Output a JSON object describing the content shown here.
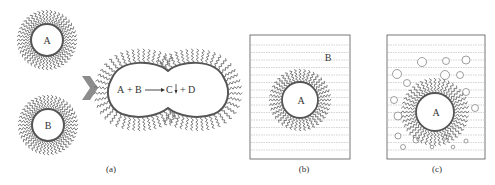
{
  "figure": {
    "panels": [
      {
        "id": "a",
        "caption": "(a)",
        "micelles": [
          {
            "label": "A"
          },
          {
            "label": "B"
          }
        ],
        "merged_reaction": {
          "reactant1": "A",
          "plus1": "+",
          "reactant2": "B",
          "product1": "C",
          "plus2": "+",
          "product2": "D",
          "precipitate_symbol": "↓"
        }
      },
      {
        "id": "b",
        "caption": "(b)",
        "core_label": "A",
        "medium_label": "B"
      },
      {
        "id": "c",
        "caption": "(c)",
        "core_label": "A"
      }
    ],
    "colors": {
      "surfactant": "#6e6e6e",
      "arrow": "#8c8c8c",
      "dashed_lines": "#b5b5b5",
      "box_border": "#555555"
    }
  }
}
